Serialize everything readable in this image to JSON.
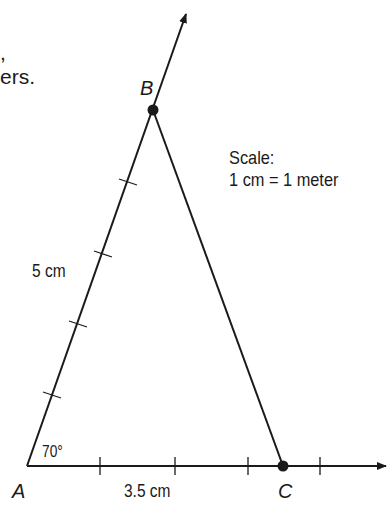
{
  "text_fragments": {
    "line1_tail": ",",
    "line2_tail": "ers."
  },
  "points": {
    "A": {
      "label": "A",
      "x": 27,
      "y": 466
    },
    "B": {
      "label": "B",
      "x": 153,
      "y": 110
    },
    "C": {
      "label": "C",
      "x": 283,
      "y": 466
    }
  },
  "measurements": {
    "side_AB": "5 cm",
    "side_AC": "3.5 cm",
    "angle_A": "70°"
  },
  "scale": {
    "title": "Scale:",
    "ratio": "1 cm = 1 meter"
  },
  "colors": {
    "ink": "#1a1a1a",
    "background": "#ffffff"
  }
}
